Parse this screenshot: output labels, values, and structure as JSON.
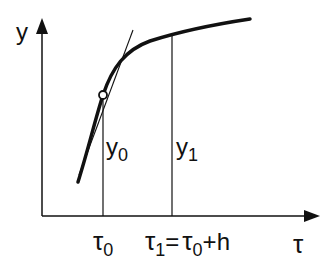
{
  "diagram": {
    "axes": {
      "y_label": "y",
      "x_label": "τ"
    },
    "points": {
      "y0_label": "y",
      "y0_sub": "0",
      "y1_label": "y",
      "y1_sub": "1",
      "tau0_label": "τ",
      "tau0_sub": "0",
      "tau1_label": "τ",
      "tau1_sub": "1",
      "tau1_eq": "=",
      "tau1_rhs_base": "τ",
      "tau1_rhs_sub": "0",
      "tau1_rhs_tail": "+h"
    },
    "colors": {
      "ink": "#111111",
      "background": "#ffffff"
    }
  }
}
